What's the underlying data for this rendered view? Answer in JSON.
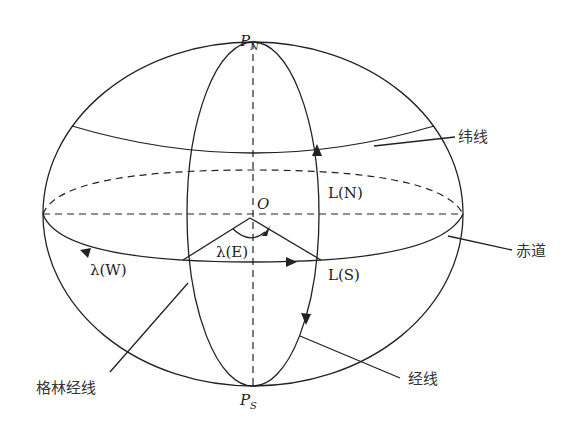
{
  "diagram": {
    "type": "globe-coordinate-diagram",
    "labels": {
      "north_pole": "P",
      "north_pole_sub": "N",
      "south_pole": "P",
      "south_pole_sub": "S",
      "center": "O",
      "latitude_north": "L(N)",
      "latitude_south": "L(S)",
      "longitude_east": "λ(E)",
      "longitude_west": "λ(W)",
      "parallel": "纬线",
      "equator": "赤道",
      "meridian": "经线",
      "greenwich_meridian": "格林经线"
    },
    "colors": {
      "stroke": "#222222",
      "background": "#ffffff"
    }
  }
}
